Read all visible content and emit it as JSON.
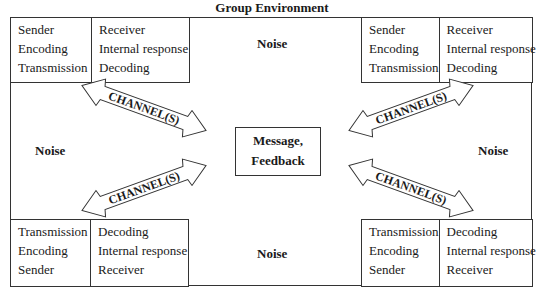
{
  "title": "Group Environment",
  "boxes": {
    "top_left": {
      "left_col": [
        "Sender",
        "Encoding",
        "Transmission"
      ],
      "right_col": [
        "Receiver",
        "Internal response",
        "Decoding"
      ]
    },
    "top_right": {
      "left_col": [
        "Sender",
        "Encoding",
        "Transmission"
      ],
      "right_col": [
        "Receiver",
        "Internal response",
        "Decoding"
      ]
    },
    "bottom_left": {
      "left_col": [
        "Transmission",
        "Encoding",
        "Sender"
      ],
      "right_col": [
        "Decoding",
        "Internal response",
        "Receiver"
      ]
    },
    "bottom_right": {
      "left_col": [
        "Transmission",
        "Encoding",
        "Sender"
      ],
      "right_col": [
        "Decoding",
        "Internal response",
        "Receiver"
      ]
    }
  },
  "noise": {
    "top": "Noise",
    "bottom": "Noise",
    "left": "Noise",
    "right": "Noise"
  },
  "center": {
    "line1": "Message,",
    "line2": "Feedback"
  },
  "channels": {
    "top_left": "CHANNEL(S)",
    "bottom_left": "CHANNEL(S)",
    "top_right": "CHANNEL(S)",
    "bottom_right": "CHANNEL(S)"
  }
}
